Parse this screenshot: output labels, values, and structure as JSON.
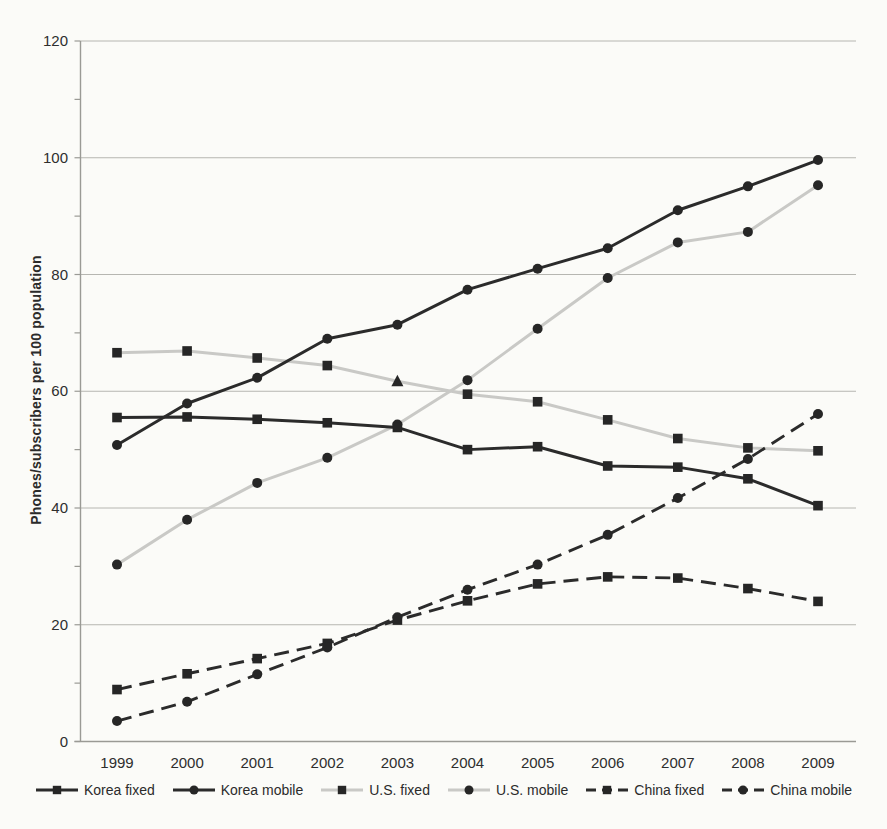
{
  "chart_data": {
    "type": "line",
    "title": "",
    "xlabel": "",
    "ylabel": "Phones/subscribers per 100 population",
    "x": [
      1999,
      2000,
      2001,
      2002,
      2003,
      2004,
      2005,
      2006,
      2007,
      2008,
      2009
    ],
    "ylim": [
      0,
      120
    ],
    "yticks": [
      0,
      20,
      40,
      60,
      80,
      100,
      120
    ],
    "y_minor_tick_step": 10,
    "grid": "horizontal",
    "legend_position": "bottom",
    "colors": {
      "dark_series": "#2b2b2b",
      "gray_series": "#c9c9c6",
      "marker": "#262626",
      "gridline": "#b6b6b1",
      "axis": "#9a9a95",
      "text": "#2b2b2b",
      "background": "#fbfbf8"
    },
    "series": [
      {
        "name": "Korea fixed",
        "line_color": "#2b2b2b",
        "dash": "solid",
        "marker": "square",
        "marker_color": "#262626",
        "values": [
          55.5,
          55.6,
          55.2,
          54.6,
          53.8,
          50.0,
          50.5,
          47.2,
          47.0,
          45.0,
          40.4
        ]
      },
      {
        "name": "Korea mobile",
        "line_color": "#2b2b2b",
        "dash": "solid",
        "marker": "circle",
        "marker_color": "#262626",
        "values": [
          50.8,
          57.9,
          62.3,
          69.0,
          71.4,
          77.4,
          81.0,
          84.5,
          91.0,
          95.1,
          99.6
        ]
      },
      {
        "name": "U.S. fixed",
        "line_color": "#c9c9c6",
        "dash": "solid",
        "marker": "square",
        "marker_color": "#262626",
        "special_markers": {
          "4": "triangle"
        },
        "values": [
          66.6,
          66.9,
          65.7,
          64.4,
          61.7,
          59.5,
          58.2,
          55.1,
          51.9,
          50.3,
          49.8
        ]
      },
      {
        "name": "U.S. mobile",
        "line_color": "#c9c9c6",
        "dash": "solid",
        "marker": "circle",
        "marker_color": "#262626",
        "values": [
          30.3,
          38.0,
          44.3,
          48.6,
          54.3,
          61.9,
          70.7,
          79.4,
          85.5,
          87.3,
          95.3
        ]
      },
      {
        "name": "China fixed",
        "line_color": "#2b2b2b",
        "dash": "dashed",
        "marker": "square",
        "marker_color": "#262626",
        "values": [
          8.9,
          11.6,
          14.2,
          16.8,
          20.8,
          24.1,
          27.0,
          28.2,
          28.0,
          26.2,
          24.0
        ]
      },
      {
        "name": "China mobile",
        "line_color": "#2b2b2b",
        "dash": "dashed",
        "marker": "circle",
        "marker_color": "#262626",
        "values": [
          3.5,
          6.8,
          11.5,
          16.1,
          21.3,
          26.0,
          30.3,
          35.4,
          41.7,
          48.4,
          56.1
        ]
      }
    ]
  }
}
